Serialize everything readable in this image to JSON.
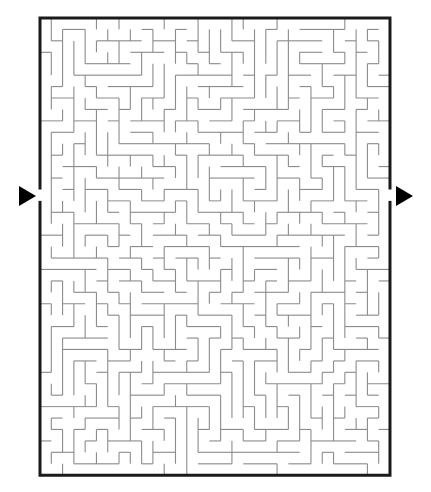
{
  "page": {
    "background_color": "#ffffff",
    "width": 431,
    "height": 492
  },
  "maze": {
    "label": "rectangular-maze",
    "type": "perfect-maze",
    "columns": 31,
    "rows": 40,
    "origin_x": 40,
    "origin_y": 18,
    "cell_width": 11.29,
    "cell_height": 11.43,
    "border_color": "#1a1a1a",
    "border_thickness": 3,
    "wall_color": "#8c8c8c",
    "wall_thickness": 1.1,
    "interior_color": "#ffffff",
    "entrance": {
      "label": "entrance",
      "side": "left",
      "row": 15,
      "gap_rows": 1
    },
    "exit": {
      "label": "exit",
      "side": "right",
      "row": 15,
      "gap_rows": 1
    },
    "seed": 20240517
  },
  "markers": [
    {
      "name": "entrance-arrow",
      "label": "Entrance",
      "direction": "right",
      "color": "#000000",
      "x": 19,
      "y": 186,
      "width": 17,
      "height": 21
    },
    {
      "name": "exit-arrow",
      "label": "Exit",
      "direction": "right",
      "color": "#000000",
      "x": 396,
      "y": 186,
      "width": 17,
      "height": 21
    }
  ]
}
